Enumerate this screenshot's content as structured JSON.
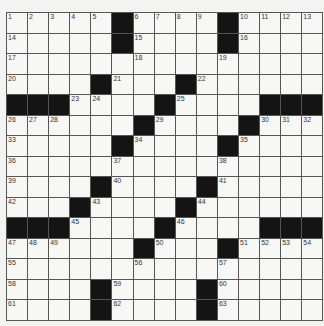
{
  "puzzle": {
    "rows": 15,
    "cols": 15,
    "colors": {
      "background": "#f3f3f1",
      "cell": "#f7f7f5",
      "block": "#141414",
      "line": "#555555",
      "number": "#333333"
    },
    "layout": [
      "00000#0000#0000",
      "00000#0000#0000",
      "000000000000000",
      "0000#000#000000",
      "###00000#0000###",
      "000000#0000#000",
      "00000#0000#0000",
      "000000000000000",
      "0000#0000#00000",
      "000#0000#000000",
      "###0000#0000###",
      "000000#000#0000",
      "000000000000000",
      "0000#0000#00000",
      "0000#0000#00000"
    ],
    "blocks": [
      [
        0,
        5
      ],
      [
        0,
        10
      ],
      [
        1,
        5
      ],
      [
        1,
        10
      ],
      [
        3,
        4
      ],
      [
        3,
        8
      ],
      [
        4,
        0
      ],
      [
        4,
        1
      ],
      [
        4,
        2
      ],
      [
        4,
        7
      ],
      [
        4,
        12
      ],
      [
        4,
        13
      ],
      [
        4,
        14
      ],
      [
        5,
        6
      ],
      [
        5,
        11
      ],
      [
        6,
        5
      ],
      [
        6,
        10
      ],
      [
        8,
        4
      ],
      [
        8,
        9
      ],
      [
        9,
        3
      ],
      [
        9,
        8
      ],
      [
        10,
        0
      ],
      [
        10,
        1
      ],
      [
        10,
        2
      ],
      [
        10,
        7
      ],
      [
        10,
        12
      ],
      [
        10,
        13
      ],
      [
        10,
        14
      ],
      [
        11,
        6
      ],
      [
        11,
        10
      ],
      [
        13,
        4
      ],
      [
        13,
        9
      ],
      [
        14,
        4
      ],
      [
        14,
        9
      ]
    ],
    "numbers": [
      {
        "r": 0,
        "c": 0,
        "n": "1"
      },
      {
        "r": 0,
        "c": 1,
        "n": "2"
      },
      {
        "r": 0,
        "c": 2,
        "n": "3"
      },
      {
        "r": 0,
        "c": 3,
        "n": "4"
      },
      {
        "r": 0,
        "c": 4,
        "n": "5"
      },
      {
        "r": 0,
        "c": 6,
        "n": "6"
      },
      {
        "r": 0,
        "c": 7,
        "n": "7"
      },
      {
        "r": 0,
        "c": 8,
        "n": "8"
      },
      {
        "r": 0,
        "c": 9,
        "n": "9"
      },
      {
        "r": 0,
        "c": 11,
        "n": "10"
      },
      {
        "r": 0,
        "c": 12,
        "n": "11"
      },
      {
        "r": 0,
        "c": 13,
        "n": "12"
      },
      {
        "r": 0,
        "c": 14,
        "n": "13"
      },
      {
        "r": 1,
        "c": 0,
        "n": "14"
      },
      {
        "r": 1,
        "c": 6,
        "n": "15"
      },
      {
        "r": 1,
        "c": 11,
        "n": "16"
      },
      {
        "r": 2,
        "c": 0,
        "n": "17"
      },
      {
        "r": 2,
        "c": 6,
        "n": "18"
      },
      {
        "r": 2,
        "c": 10,
        "n": "19"
      },
      {
        "r": 3,
        "c": 0,
        "n": "20"
      },
      {
        "r": 3,
        "c": 5,
        "n": "21"
      },
      {
        "r": 3,
        "c": 9,
        "n": "22"
      },
      {
        "r": 4,
        "c": 3,
        "n": "23"
      },
      {
        "r": 4,
        "c": 4,
        "n": "24"
      },
      {
        "r": 4,
        "c": 8,
        "n": "25"
      },
      {
        "r": 5,
        "c": 0,
        "n": "26"
      },
      {
        "r": 5,
        "c": 1,
        "n": "27"
      },
      {
        "r": 5,
        "c": 2,
        "n": "28"
      },
      {
        "r": 5,
        "c": 7,
        "n": "29"
      },
      {
        "r": 5,
        "c": 12,
        "n": "30"
      },
      {
        "r": 5,
        "c": 13,
        "n": "31"
      },
      {
        "r": 5,
        "c": 14,
        "n": "32"
      },
      {
        "r": 6,
        "c": 0,
        "n": "33"
      },
      {
        "r": 6,
        "c": 6,
        "n": "34"
      },
      {
        "r": 6,
        "c": 11,
        "n": "35"
      },
      {
        "r": 7,
        "c": 0,
        "n": "36"
      },
      {
        "r": 7,
        "c": 5,
        "n": "37"
      },
      {
        "r": 7,
        "c": 10,
        "n": "38"
      },
      {
        "r": 8,
        "c": 0,
        "n": "39"
      },
      {
        "r": 8,
        "c": 5,
        "n": "40"
      },
      {
        "r": 8,
        "c": 10,
        "n": "41"
      },
      {
        "r": 9,
        "c": 0,
        "n": "42"
      },
      {
        "r": 9,
        "c": 4,
        "n": "43"
      },
      {
        "r": 9,
        "c": 9,
        "n": "44"
      },
      {
        "r": 10,
        "c": 3,
        "n": "45"
      },
      {
        "r": 10,
        "c": 8,
        "n": "46"
      },
      {
        "r": 11,
        "c": 0,
        "n": "47"
      },
      {
        "r": 11,
        "c": 1,
        "n": "48"
      },
      {
        "r": 11,
        "c": 2,
        "n": "49"
      },
      {
        "r": 11,
        "c": 7,
        "n": "50"
      },
      {
        "r": 11,
        "c": 11,
        "n": "51"
      },
      {
        "r": 11,
        "c": 12,
        "n": "52"
      },
      {
        "r": 11,
        "c": 13,
        "n": "53"
      },
      {
        "r": 11,
        "c": 14,
        "n": "54"
      },
      {
        "r": 12,
        "c": 0,
        "n": "55"
      },
      {
        "r": 12,
        "c": 6,
        "n": "56"
      },
      {
        "r": 12,
        "c": 10,
        "n": "57"
      },
      {
        "r": 13,
        "c": 0,
        "n": "58"
      },
      {
        "r": 13,
        "c": 5,
        "n": "59"
      },
      {
        "r": 13,
        "c": 10,
        "n": "60"
      },
      {
        "r": 14,
        "c": 0,
        "n": "61"
      },
      {
        "r": 14,
        "c": 5,
        "n": "62"
      },
      {
        "r": 14,
        "c": 10,
        "n": "63"
      }
    ]
  }
}
